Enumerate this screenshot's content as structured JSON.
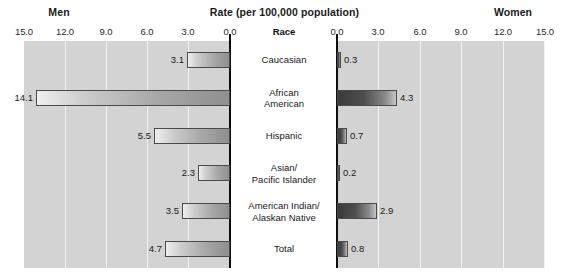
{
  "header": {
    "left_label": "Men",
    "center_title": "Rate (per 100,000 population)",
    "right_label": "Women",
    "category_header": "Race"
  },
  "axes": {
    "left_ticks": [
      "15.0",
      "12.0",
      "9.0",
      "6.0",
      "3.0",
      "0.0"
    ],
    "right_ticks": [
      "0.0",
      "3.0",
      "6.0",
      "9.0",
      "12.0",
      "15.0"
    ],
    "max": 15.0,
    "min": 0.0,
    "tick_step": 3.0,
    "gridlines": true
  },
  "colors": {
    "panel_background": "#d3d3d3",
    "gridline": "#f2f2f2",
    "axis": "#0d0d0d",
    "men_bar_light": "#efefef",
    "men_bar_dark": "#8f8f8f",
    "women_bar_dark": "#3a3a3a",
    "women_bar_light": "#c4c4c4",
    "bar_border": "#4a4a4a",
    "page_background": "#ffffff"
  },
  "chart_data": {
    "type": "bar",
    "title": "Rate (per 100,000 population)",
    "subtitle": "",
    "xlabel": "Rate (per 100,000 population)",
    "ylabel": "Race",
    "orientation": "horizontal",
    "layout": "diverging-bidirectional",
    "categories": [
      "Caucasian",
      "African American",
      "Hispanic",
      "Asian/ Pacific Islander",
      "American Indian/ Alaskan Native",
      "Total"
    ],
    "category_lines": [
      [
        "Caucasian"
      ],
      [
        "African",
        "American"
      ],
      [
        "Hispanic"
      ],
      [
        "Asian/",
        "Pacific Islander"
      ],
      [
        "American Indian/",
        "Alaskan Native"
      ],
      [
        "Total"
      ]
    ],
    "series": [
      {
        "name": "Men",
        "side": "left",
        "values": [
          3.1,
          14.1,
          5.5,
          2.3,
          3.5,
          4.7
        ],
        "labels": [
          "3.1",
          "14.1",
          "5.5",
          "2.3",
          "3.5",
          "4.7"
        ]
      },
      {
        "name": "Women",
        "side": "right",
        "values": [
          0.3,
          4.3,
          0.7,
          0.2,
          2.9,
          0.8
        ],
        "labels": [
          "0.3",
          "4.3",
          "0.7",
          "0.2",
          "2.9",
          "0.8"
        ]
      }
    ],
    "xlim": [
      0,
      15
    ],
    "grid": true,
    "legend": "none"
  }
}
